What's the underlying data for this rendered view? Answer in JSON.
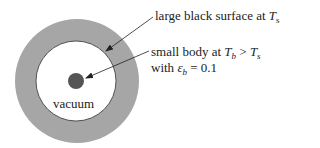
{
  "diagram": {
    "labels": {
      "surface": {
        "text": "large black surface at ",
        "var": "T",
        "sub": "s"
      },
      "body_line1": {
        "text": "small body at ",
        "var1": "T",
        "sub1": "b",
        "op": " > ",
        "var2": "T",
        "sub2": "s"
      },
      "body_line2": {
        "text": "with ",
        "var": "ε",
        "sub": "b",
        "rest": " = 0.1"
      },
      "vacuum": "vacuum"
    },
    "colors": {
      "ring": "#a6a6a6",
      "inner": "#ffffff",
      "body": "#555555",
      "stroke": "#333333"
    }
  }
}
